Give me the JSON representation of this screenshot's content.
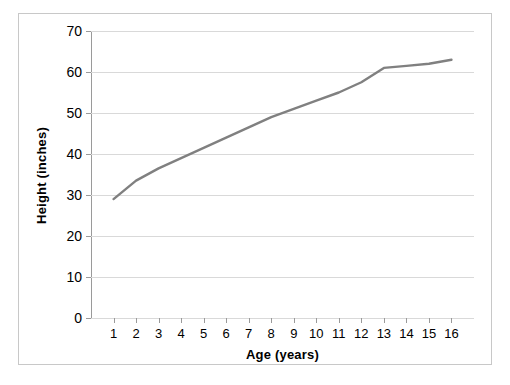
{
  "chart_data": {
    "type": "line",
    "title": "",
    "xlabel": "Age (years)",
    "ylabel": "Height (inches)",
    "xlim": [
      0,
      17
    ],
    "ylim": [
      0,
      70
    ],
    "yticks": [
      0,
      10,
      20,
      30,
      40,
      50,
      60,
      70
    ],
    "xticks": [
      1,
      2,
      3,
      4,
      5,
      6,
      7,
      8,
      9,
      10,
      11,
      12,
      13,
      14,
      15,
      16
    ],
    "grid": "horizontal",
    "legend": "none",
    "series": [
      {
        "name": "Height",
        "color": "#808080",
        "x": [
          1,
          2,
          3,
          4,
          5,
          6,
          7,
          8,
          9,
          10,
          11,
          12,
          13,
          14,
          15,
          16
        ],
        "values": [
          29,
          33.5,
          36.5,
          39,
          41.5,
          44,
          46.5,
          49,
          51,
          53,
          55,
          57.5,
          61,
          61.5,
          62,
          63
        ]
      }
    ],
    "annotations": []
  },
  "axes": {
    "y_tick_labels": [
      "0",
      "10",
      "20",
      "30",
      "40",
      "50",
      "60",
      "70"
    ],
    "x_tick_labels": [
      "1",
      "2",
      "3",
      "4",
      "5",
      "6",
      "7",
      "8",
      "9",
      "10",
      "11",
      "12",
      "13",
      "14",
      "15",
      "16"
    ],
    "x_title": "Age (years)",
    "y_title": "Height (inches)"
  },
  "style": {
    "line_color": "#808080",
    "grid_color": "#d9d9d9",
    "axis_color": "#9a9a9a",
    "frame_color": "#c8c8c8",
    "background": "#ffffff"
  }
}
